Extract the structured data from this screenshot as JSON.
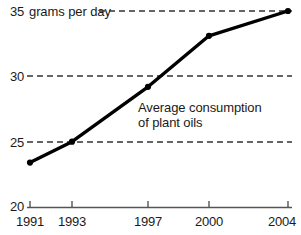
{
  "chart_data": {
    "type": "line",
    "title": "",
    "subtitle": "",
    "xlabel": "",
    "ylabel": "grams per day",
    "units_label": "grams per day",
    "x": [
      "1991",
      "1993",
      "1997",
      "2000",
      "2004"
    ],
    "categories": [
      "1991",
      "1993",
      "1997",
      "2000",
      "2004"
    ],
    "values": [
      23.4,
      25.0,
      29.2,
      33.1,
      35.0
    ],
    "series": [
      {
        "name": "Average consumption of plant oils",
        "values": [
          23.4,
          25.0,
          29.2,
          33.1,
          35.0
        ]
      }
    ],
    "xlim": [
      1991,
      2004
    ],
    "ylim": [
      20,
      35
    ],
    "yticks": [
      "20",
      "25",
      "30",
      "35"
    ],
    "ytick_values": [
      20,
      25,
      30,
      35
    ],
    "xticks": [
      "1991",
      "1993",
      "1997",
      "2000",
      "2004"
    ],
    "grid": true,
    "grid_style": "dashed-horizontal",
    "legend": "none",
    "annotations": [
      {
        "line1": "Average consumption",
        "line2": "of plant oils"
      }
    ],
    "colors": {
      "line": "#000000",
      "marker": "#000000",
      "grid": "#333333",
      "axis": "#555555",
      "text": "#1a1a1a",
      "background": "#ffffff"
    }
  },
  "axis": {
    "y_labels": [
      "35",
      "30",
      "25",
      "20"
    ],
    "x_labels": [
      "1991",
      "1993",
      "1997",
      "2000",
      "2004"
    ]
  },
  "labels": {
    "units": "grams per day",
    "annotation_line1": "Average consumption",
    "annotation_line2": "of plant oils"
  }
}
